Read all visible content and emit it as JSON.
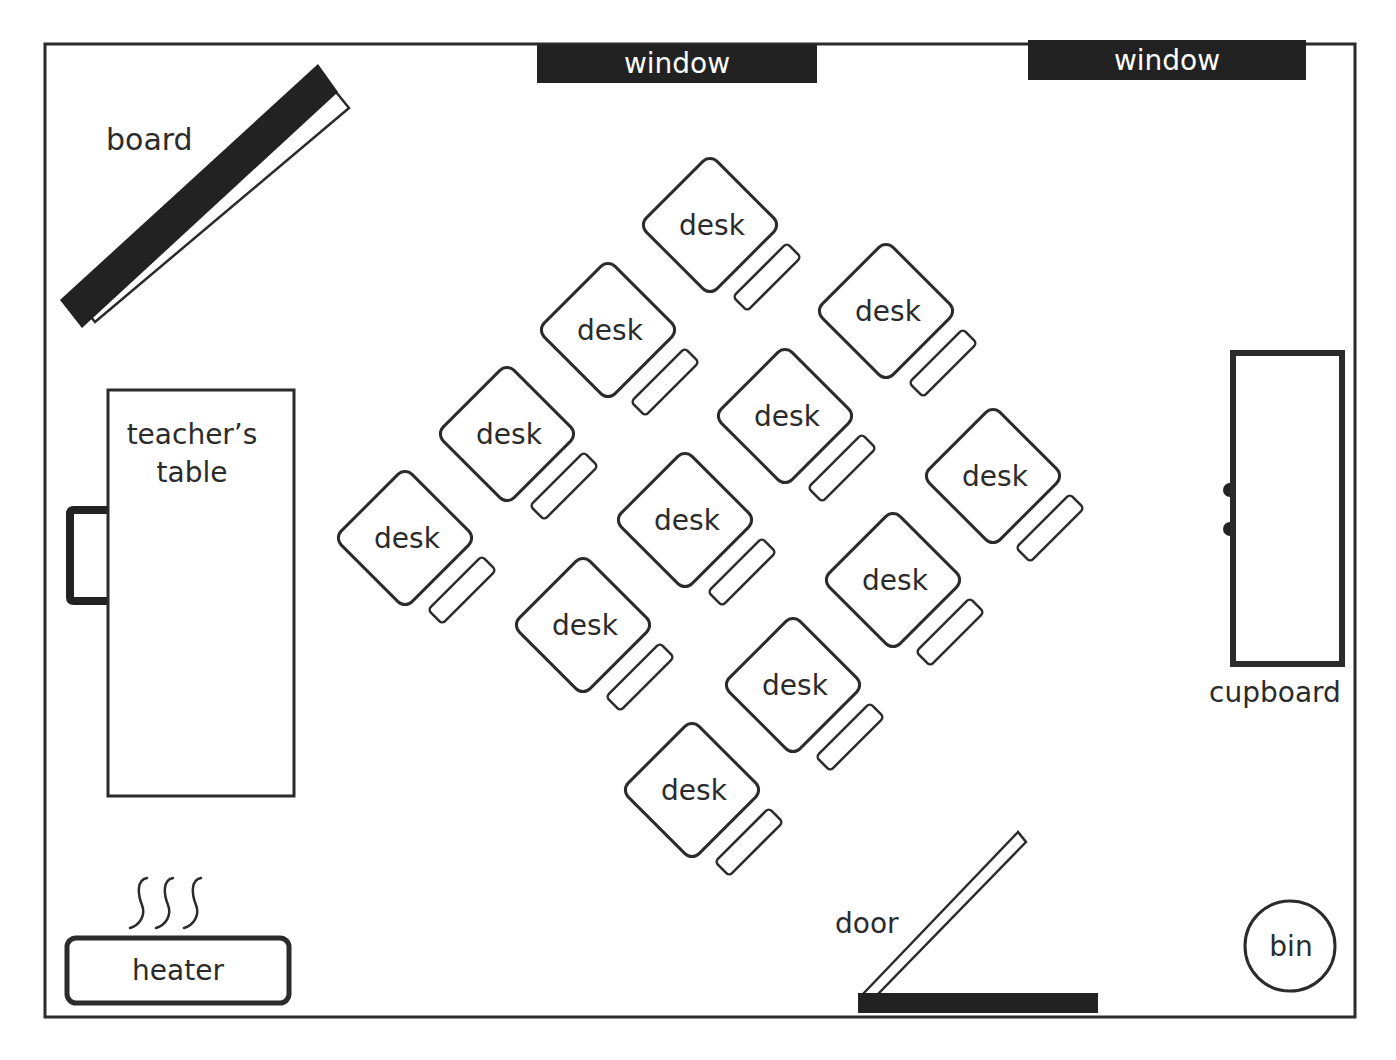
{
  "diagram": {
    "colors": {
      "ink": "#2b2b2b",
      "fill_dark": "#222222",
      "background": "#ffffff"
    },
    "room": {
      "x": 45,
      "y": 43,
      "width": 1310,
      "height": 975
    },
    "windows": [
      {
        "label": "window",
        "x": 537,
        "y": 45,
        "width": 280,
        "height": 38
      },
      {
        "label": "window",
        "x": 1028,
        "y": 40,
        "width": 278,
        "height": 40
      }
    ],
    "board": {
      "label": "board"
    },
    "teachers_table": {
      "label_line1": "teacher’s",
      "label_line2": "table"
    },
    "heater": {
      "label": "heater",
      "heat_icon": "heat-waves-icon"
    },
    "door": {
      "label": "door"
    },
    "bin": {
      "label": "bin"
    },
    "cupboard": {
      "label": "cupboard"
    },
    "desks": [
      {
        "label": "desk",
        "cx": 710,
        "cy": 225
      },
      {
        "label": "desk",
        "cx": 608,
        "cy": 330
      },
      {
        "label": "desk",
        "cx": 886,
        "cy": 311
      },
      {
        "label": "desk",
        "cx": 507,
        "cy": 434
      },
      {
        "label": "desk",
        "cx": 785,
        "cy": 416
      },
      {
        "label": "desk",
        "cx": 405,
        "cy": 538
      },
      {
        "label": "desk",
        "cx": 685,
        "cy": 520
      },
      {
        "label": "desk",
        "cx": 993,
        "cy": 476
      },
      {
        "label": "desk",
        "cx": 583,
        "cy": 625
      },
      {
        "label": "desk",
        "cx": 893,
        "cy": 580
      },
      {
        "label": "desk",
        "cx": 793,
        "cy": 685
      },
      {
        "label": "desk",
        "cx": 692,
        "cy": 790
      }
    ]
  }
}
